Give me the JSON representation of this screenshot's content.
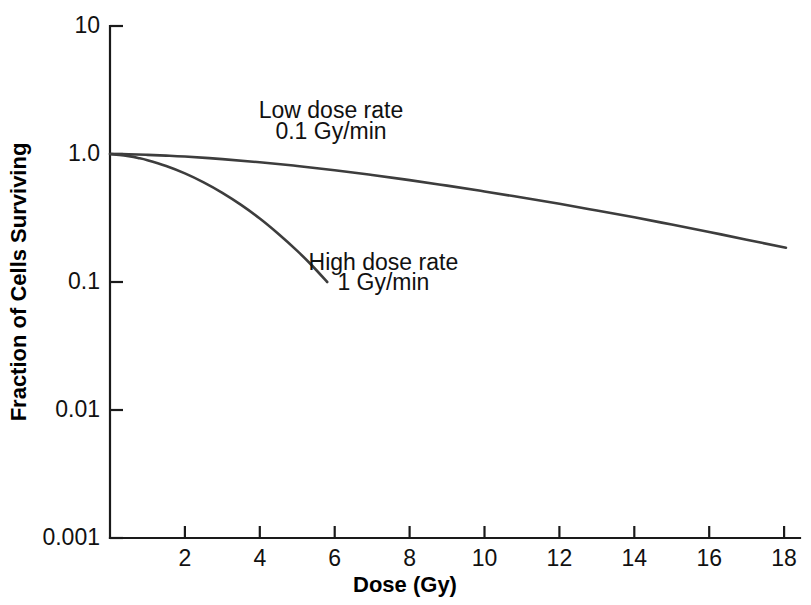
{
  "chart_data": {
    "type": "line",
    "title": "",
    "xlabel": "Dose (Gy)",
    "ylabel": "Fraction of Cells Surviving",
    "xlim": [
      0,
      18.8
    ],
    "ylim": [
      0.001,
      10
    ],
    "yscale": "log",
    "xscale": "linear",
    "grid": false,
    "legend_position": "inline-annotations",
    "xticks": [
      2,
      4,
      6,
      8,
      10,
      12,
      14,
      16,
      18
    ],
    "xtick_labels": [
      "2",
      "4",
      "6",
      "8",
      "10",
      "12",
      "14",
      "16",
      "18"
    ],
    "yticks": [
      10,
      1.0,
      0.1,
      0.01,
      0.001
    ],
    "ytick_labels": [
      "10",
      "1.0",
      "0.1",
      "0.01",
      "0.001"
    ],
    "series": [
      {
        "name": "Low dose rate",
        "rate": "0.1 Gy/min",
        "color": "#3d3d3d",
        "annotation_line1": "Low dose rate",
        "annotation_line2": "0.1 Gy/min",
        "x": [
          0,
          0.5,
          1,
          1.5,
          2,
          3,
          4,
          5,
          6,
          7,
          8,
          9,
          10,
          11,
          12,
          13,
          14,
          15,
          16,
          17,
          18.05
        ],
        "y": [
          1.0,
          0.995,
          0.985,
          0.972,
          0.955,
          0.912,
          0.862,
          0.806,
          0.747,
          0.686,
          0.625,
          0.566,
          0.51,
          0.457,
          0.408,
          0.362,
          0.32,
          0.281,
          0.246,
          0.214,
          0.185
        ]
      },
      {
        "name": "High dose rate",
        "rate": "1 Gy/min",
        "color": "#3d3d3d",
        "annotation_line1": "High dose rate",
        "annotation_line2": "1 Gy/min",
        "x": [
          0,
          0.25,
          0.5,
          0.75,
          1,
          1.5,
          2,
          2.5,
          3,
          3.5,
          4,
          4.5,
          5,
          5.4,
          5.8
        ],
        "y": [
          1.0,
          0.985,
          0.962,
          0.932,
          0.895,
          0.805,
          0.705,
          0.6,
          0.497,
          0.4,
          0.313,
          0.237,
          0.175,
          0.134,
          0.1
        ]
      }
    ],
    "annotations": [
      {
        "text": "Low dose rate",
        "x_gy": 5.9,
        "y_frac": 1.9
      },
      {
        "text": "0.1 Gy/min",
        "x_gy": 5.9,
        "y_frac": 1.3
      },
      {
        "text": "High dose rate",
        "x_gy": 7.3,
        "y_frac": 0.125
      },
      {
        "text": "1 Gy/min",
        "x_gy": 7.3,
        "y_frac": 0.087
      }
    ]
  },
  "axes": {
    "y_title": "Fraction of Cells Surviving",
    "x_title": "Dose (Gy)",
    "y_labels": [
      "10",
      "1.0",
      "0.1",
      "0.01",
      "0.001"
    ],
    "x_labels": [
      "2",
      "4",
      "6",
      "8",
      "10",
      "12",
      "14",
      "16",
      "18"
    ]
  },
  "annotations": {
    "low_dose_rate_line1": "Low dose rate",
    "low_dose_rate_line2": "0.1 Gy/min",
    "high_dose_rate_line1": "High dose rate",
    "high_dose_rate_line2": "1 Gy/min"
  },
  "colors": {
    "curve": "#3d3d3d",
    "axis": "#1a1a1a",
    "text": "#111111",
    "background": "#ffffff"
  }
}
